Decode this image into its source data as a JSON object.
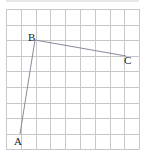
{
  "diagram": {
    "type": "grid-geometry",
    "grid": {
      "columns": 9,
      "rows": 9,
      "origin_x": 6,
      "origin_y": 9,
      "cell_w": 14.8,
      "cell_h": 15.6,
      "line_color": "#c8c8c8",
      "top_rule_color": "#d0d0d0"
    },
    "points": [
      {
        "label": "A",
        "x": 20,
        "y": 134,
        "label_x": 14,
        "label_y": 145
      },
      {
        "label": "B",
        "x": 35,
        "y": 40,
        "label_x": 28,
        "label_y": 41
      },
      {
        "label": "C",
        "x": 126,
        "y": 56,
        "label_x": 124,
        "label_y": 64
      }
    ],
    "segments": [
      {
        "from": "A",
        "to": "B"
      },
      {
        "from": "B",
        "to": "C"
      }
    ],
    "segment_color": "#8a8a9a"
  }
}
